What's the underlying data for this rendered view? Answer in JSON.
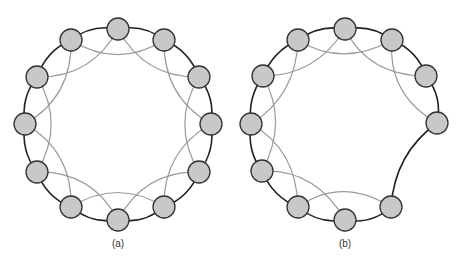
{
  "figures": [
    {
      "label": "(a)",
      "label_pos": [
        118,
        238
      ],
      "node_fill": "#c8c8c8",
      "node_stroke": "#333333",
      "ring_stroke": "#222222",
      "chord_stroke": "#9a9a9a",
      "nodes": [
        [
          118,
          29
        ],
        [
          164,
          40
        ],
        [
          199,
          77
        ],
        [
          211,
          124
        ],
        [
          199,
          172
        ],
        [
          164,
          207
        ],
        [
          118,
          220
        ],
        [
          71,
          207
        ],
        [
          37,
          172
        ],
        [
          25,
          124
        ],
        [
          37,
          77
        ],
        [
          71,
          40
        ]
      ],
      "ring": [
        [
          0,
          1
        ],
        [
          1,
          2
        ],
        [
          2,
          3
        ],
        [
          3,
          4
        ],
        [
          4,
          5
        ],
        [
          5,
          6
        ],
        [
          6,
          7
        ],
        [
          7,
          8
        ],
        [
          8,
          9
        ],
        [
          9,
          10
        ],
        [
          10,
          11
        ],
        [
          11,
          0
        ]
      ],
      "chords": [
        [
          0,
          2
        ],
        [
          1,
          3
        ],
        [
          2,
          4
        ],
        [
          3,
          5
        ],
        [
          4,
          6
        ],
        [
          5,
          7
        ],
        [
          6,
          8
        ],
        [
          7,
          9
        ],
        [
          8,
          10
        ],
        [
          9,
          11
        ],
        [
          10,
          0
        ],
        [
          11,
          1
        ]
      ],
      "bridge": []
    },
    {
      "label": "(b)",
      "label_pos": [
        345,
        238
      ],
      "node_fill": "#c8c8c8",
      "node_stroke": "#333333",
      "ring_stroke": "#222222",
      "chord_stroke": "#9a9a9a",
      "nodes": [
        [
          345,
          29
        ],
        [
          392,
          40
        ],
        [
          426,
          76
        ],
        [
          437,
          123
        ],
        [
          391,
          207
        ],
        [
          345,
          220
        ],
        [
          298,
          207
        ],
        [
          262,
          171
        ],
        [
          251,
          124
        ],
        [
          263,
          76
        ],
        [
          298,
          40
        ]
      ],
      "ring": [
        [
          0,
          1
        ],
        [
          1,
          2
        ],
        [
          2,
          3
        ],
        [
          4,
          5
        ],
        [
          5,
          6
        ],
        [
          6,
          7
        ],
        [
          7,
          8
        ],
        [
          8,
          9
        ],
        [
          9,
          10
        ],
        [
          10,
          0
        ]
      ],
      "chords": [
        [
          0,
          2
        ],
        [
          1,
          3
        ],
        [
          4,
          6
        ],
        [
          5,
          7
        ],
        [
          6,
          8
        ],
        [
          7,
          9
        ],
        [
          8,
          10
        ],
        [
          9,
          0
        ],
        [
          10,
          1
        ]
      ],
      "bridge": [
        [
          3,
          4
        ]
      ]
    }
  ]
}
